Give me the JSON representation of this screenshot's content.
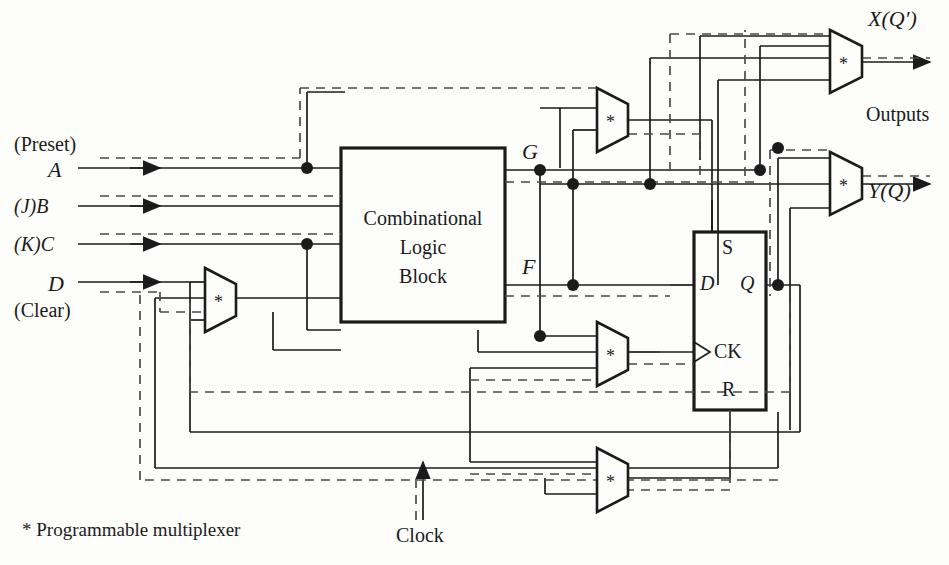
{
  "figure": {
    "kind": "logic-block-diagram",
    "title_text": "",
    "background": "#fdfdfc",
    "line_color": "#1b1b1b",
    "dashed_color": "#4a4a4a"
  },
  "inputs": [
    {
      "id": "preset",
      "label": "(Preset)",
      "x": 14,
      "y": 133
    },
    {
      "id": "a",
      "label": "A",
      "x": 48,
      "y": 160
    },
    {
      "id": "jb",
      "label": "(J)B",
      "x": 14,
      "y": 198
    },
    {
      "id": "kc",
      "label": "(K)C",
      "x": 14,
      "y": 237
    },
    {
      "id": "d",
      "label": "D",
      "x": 48,
      "y": 275
    },
    {
      "id": "clear",
      "label": "(Clear)",
      "x": 14,
      "y": 303
    }
  ],
  "logic_block": {
    "line1": "Combinational",
    "line2": "Logic",
    "line3": "Block",
    "x": 341,
    "y": 148,
    "w": 164,
    "h": 174
  },
  "block_outputs": [
    {
      "id": "g",
      "label": "G",
      "x": 522,
      "y": 140
    },
    {
      "id": "f",
      "label": "F",
      "x": 522,
      "y": 255
    }
  ],
  "flipflop": {
    "x": 694,
    "y": 232,
    "w": 72,
    "h": 178,
    "pin_s": "S",
    "pin_d": "D",
    "pin_q": "Q",
    "pin_ck": "CK",
    "pin_r": "R"
  },
  "muxes": [
    {
      "id": "mux-g-top",
      "symbol": "*",
      "x": 597,
      "y": 88,
      "w": 31,
      "h": 64
    },
    {
      "id": "mux-x-out",
      "symbol": "*",
      "x": 830,
      "y": 30,
      "w": 32,
      "h": 63
    },
    {
      "id": "mux-y-out",
      "symbol": "*",
      "x": 830,
      "y": 152,
      "w": 32,
      "h": 63
    },
    {
      "id": "mux-d-in",
      "symbol": "*",
      "x": 205,
      "y": 268,
      "w": 31,
      "h": 64
    },
    {
      "id": "mux-clock",
      "symbol": "*",
      "x": 597,
      "y": 322,
      "w": 31,
      "h": 64
    },
    {
      "id": "mux-bottom",
      "symbol": "*",
      "x": 597,
      "y": 448,
      "w": 31,
      "h": 64
    }
  ],
  "outputs": [
    {
      "id": "x",
      "label": "X(Q′)",
      "x": 868,
      "y": 8,
      "group": "Outputs"
    },
    {
      "id": "y",
      "label": "Y(Q)",
      "x": 868,
      "y": 178,
      "group": "Outputs"
    }
  ],
  "annotations": {
    "outputs_group": "Outputs",
    "outputs_group_x": 866,
    "outputs_group_y": 105,
    "clock_label": "Clock",
    "clock_x": 396,
    "clock_y": 524,
    "footnote": "* Programmable multiplexer",
    "footnote_x": 22,
    "footnote_y": 519
  }
}
